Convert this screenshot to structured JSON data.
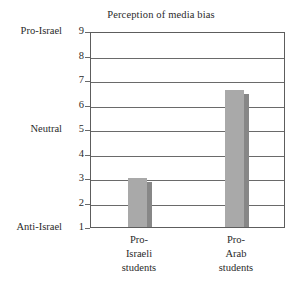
{
  "chart_data": {
    "type": "bar",
    "title": "Perception of media bias",
    "xlabel": "",
    "ylabel": "",
    "categories": [
      "Pro-Israeli students",
      "Pro-Arab students"
    ],
    "category_lines": [
      [
        "Pro-",
        "Israeli",
        "students"
      ],
      [
        "Pro-",
        "Arab",
        "students"
      ]
    ],
    "values": [
      3.0,
      6.6
    ],
    "ylim": [
      1,
      9
    ],
    "yticks": [
      1,
      2,
      3,
      4,
      5,
      6,
      7,
      8,
      9
    ],
    "ytick_labels": [
      "1",
      "2",
      "3",
      "4",
      "5",
      "6",
      "7",
      "8",
      "9"
    ],
    "y_band_labels": [
      {
        "value": 9,
        "label": "Pro-Israel"
      },
      {
        "value": 5,
        "label": "Neutral"
      },
      {
        "value": 1,
        "label": "Anti-Israel"
      }
    ],
    "grid": true,
    "legend": false,
    "colors": {
      "bar_fill": "#a9a9a9",
      "bar_edge": "#878787",
      "frame": "#5d5d5d",
      "gridline": "#6a6a6a",
      "text": "#2a2a2a",
      "background": "#ffffff"
    }
  }
}
